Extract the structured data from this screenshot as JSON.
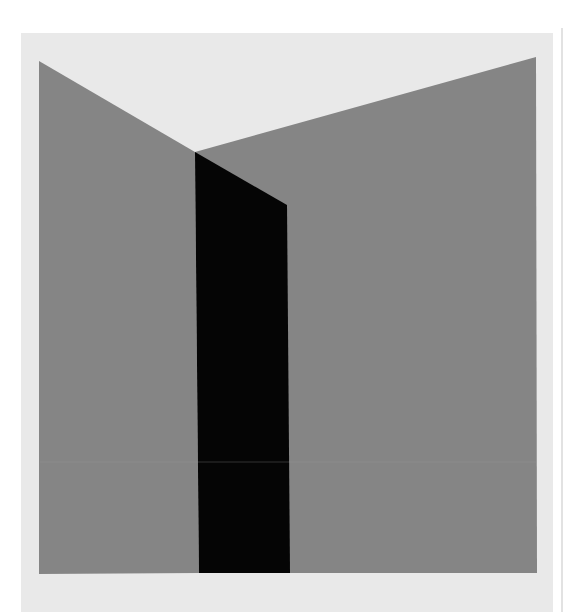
{
  "artwork": {
    "background": "#ffffff",
    "paper": {
      "color": "#e9e9e9",
      "x": 21,
      "y": 33,
      "width": 532,
      "height": 579
    },
    "edge_line": {
      "x": 562,
      "y1": 28,
      "y2": 612,
      "color": "#d8d8d8"
    },
    "left_plane": {
      "color": "#858585",
      "points": "39,61 195,152 199,573 39,574"
    },
    "right_plane": {
      "color": "#858585",
      "points": "195,152 536,57 537,573 199,573"
    },
    "black_column": {
      "color": "#050505",
      "points": "195,152 287,205 290,573 199,573"
    },
    "crease": {
      "y": 462,
      "color": "#9a9a9a"
    }
  }
}
